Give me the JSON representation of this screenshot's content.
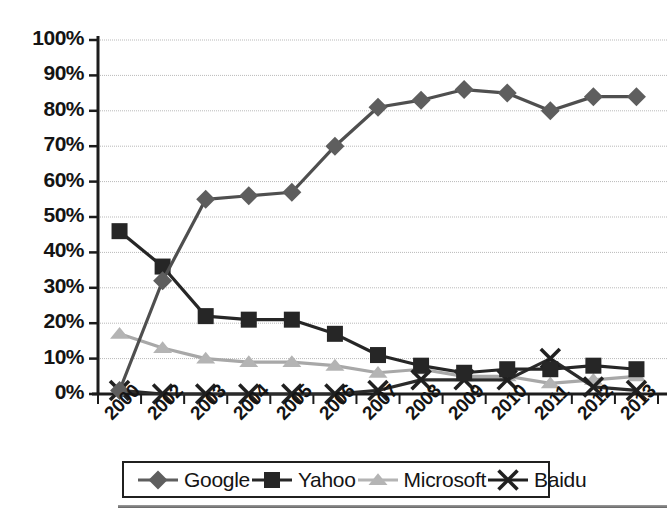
{
  "chart_data": {
    "type": "line",
    "title": "",
    "subtitle": "",
    "xlabel": "",
    "ylabel": "",
    "x": [
      "2000",
      "2002",
      "2003",
      "2004",
      "2005",
      "2006",
      "2007",
      "2008",
      "2009",
      "2010",
      "2011",
      "2012",
      "2013"
    ],
    "categories": [
      "2000",
      "2002",
      "2003",
      "2004",
      "2005",
      "2006",
      "2007",
      "2008",
      "2009",
      "2010",
      "2011",
      "2012",
      "2013"
    ],
    "ylim": [
      0,
      100
    ],
    "yticks": [
      0,
      10,
      20,
      30,
      40,
      50,
      60,
      70,
      80,
      90,
      100
    ],
    "ytick_labels": [
      "0%",
      "10%",
      "20%",
      "30%",
      "40%",
      "50%",
      "60%",
      "70%",
      "80%",
      "90%",
      "100%"
    ],
    "grid": true,
    "grid_axis": "y",
    "legend_position": "bottom",
    "units": "percent",
    "series": [
      {
        "name": "Google",
        "marker": "diamond",
        "color": "#5e5e5e",
        "line_color": "#4f4f4f",
        "values": [
          1,
          32,
          55,
          56,
          57,
          70,
          81,
          83,
          86,
          85,
          80,
          84,
          84
        ]
      },
      {
        "name": "Yahoo",
        "marker": "square",
        "color": "#262626",
        "line_color": "#262626",
        "values": [
          46,
          36,
          22,
          21,
          21,
          17,
          11,
          8,
          6,
          7,
          7,
          8,
          7
        ]
      },
      {
        "name": "Microsoft",
        "marker": "triangle",
        "color": "#b4b4b4",
        "line_color": "#a8a8a8",
        "values": [
          17,
          13,
          10,
          9,
          9,
          8,
          6,
          7,
          5,
          5,
          3,
          4,
          5
        ]
      },
      {
        "name": "Baidu",
        "marker": "x",
        "color": "#202020",
        "line_color": "#2b2b2b",
        "values": [
          1,
          0,
          0,
          0,
          0,
          0,
          1,
          4,
          4,
          4,
          10,
          2,
          1
        ]
      }
    ]
  },
  "legend": {
    "items": [
      {
        "label": "Google",
        "marker": "diamond-marker"
      },
      {
        "label": "Yahoo",
        "marker": "square-marker"
      },
      {
        "label": "Microsoft",
        "marker": "triangle-marker"
      },
      {
        "label": "Baidu",
        "marker": "x-marker"
      }
    ]
  },
  "axis": {
    "y_labels": [
      "100%",
      "90%",
      "80%",
      "70%",
      "60%",
      "50%",
      "40%",
      "30%",
      "20%",
      "10%",
      "0%"
    ],
    "x_labels": [
      "2000",
      "2002",
      "2003",
      "2004",
      "2005",
      "2006",
      "2007",
      "2008",
      "2009",
      "2010",
      "2011",
      "2012",
      "2013"
    ]
  },
  "colors": {
    "google": "#5e5e5e",
    "yahoo": "#262626",
    "microsoft": "#b4b4b4",
    "baidu": "#202020",
    "grid": "#b9b9b9",
    "axis": "#1c1c1c",
    "background": "#ffffff"
  }
}
